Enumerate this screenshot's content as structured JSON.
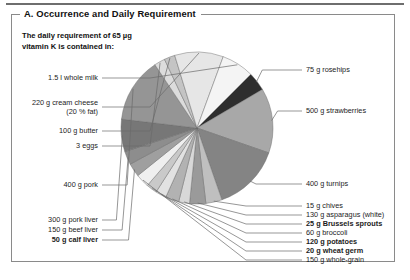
{
  "panel": {
    "title": "A. Occurrence and Daily Requirement",
    "intro": "The daily requirement of 65 µg\nvitamin K is contained in:"
  },
  "chart_data": {
    "type": "pie",
    "title": "A. Occurrence and Daily Requirement",
    "subtitle": "The daily requirement of 65 µg vitamin K is contained in:",
    "legend_position": "callout-labels",
    "grid": false,
    "unit": "percent of circle",
    "categories": [
      "75 g rosehips",
      "500 g strawberries",
      "400 g turnips",
      "15 g chives",
      "130 g asparagus (white)",
      "25 g Brussels sprouts",
      "60 g broccoli",
      "120 g potatoes",
      "20 g wheat germ",
      "150 g whole-grain",
      "50 g calf liver",
      "150 g beef liver",
      "300 g pork liver",
      "400 g pork",
      "3 eggs",
      "100 g butter",
      "220 g cream cheese (20% fat)",
      "1.5 l whole milk"
    ],
    "values": [
      3.5,
      12.0,
      12.5,
      3.0,
      3.0,
      2.0,
      2.5,
      2.0,
      2.0,
      2.5,
      2.5,
      2.5,
      6.0,
      12.0,
      2.0,
      2.0,
      9.0,
      6.0
    ],
    "slice_colors": [
      "#2e2e2e",
      "#a8a8a8",
      "#848484",
      "#bfbfbf",
      "#9a9a9a",
      "#d8d8d8",
      "#b2b2b2",
      "#e2e2e2",
      "#c9c9c9",
      "#efefef",
      "#9f9f9f",
      "#8d8d8d",
      "#777777",
      "#959595",
      "#dcdcdc",
      "#c4c4c4",
      "#e6e6e6",
      "#f4f4f4"
    ],
    "start_angle_deg": 45,
    "direction": "clockwise"
  },
  "labels": {
    "right": [
      {
        "text": "75 g rosehips",
        "bold": false
      },
      {
        "text": "500 g strawberries",
        "bold": false
      },
      {
        "text": "400 g turnips",
        "bold": false
      },
      {
        "text": "15 g chives",
        "bold": false
      },
      {
        "text": "130 g asparagus (white)",
        "bold": false
      },
      {
        "text": "25 g Brussels sprouts",
        "bold": true
      },
      {
        "text": "60 g broccoli",
        "bold": false
      },
      {
        "text": "120 g potatoes",
        "bold": true
      },
      {
        "text": "20 g wheat germ",
        "bold": true
      },
      {
        "text": "150 g whole-grain",
        "bold": false
      }
    ],
    "left": [
      {
        "text": "1.5 l whole milk",
        "bold": false
      },
      {
        "text": "220 g cream cheese\n(20 % fat)",
        "bold": false
      },
      {
        "text": "100 g butter",
        "bold": false
      },
      {
        "text": "3 eggs",
        "bold": false
      },
      {
        "text": "400 g pork",
        "bold": false
      },
      {
        "text": "300 g pork liver",
        "bold": false
      },
      {
        "text": "150 g beef liver",
        "bold": false
      },
      {
        "text": "50 g calf liver",
        "bold": true
      }
    ]
  },
  "colors": {
    "panel_border": "#8a8a8a",
    "leader_line": "#6a6a6a",
    "text": "#1c1c1c",
    "top_rule": "#6e6e6e"
  }
}
